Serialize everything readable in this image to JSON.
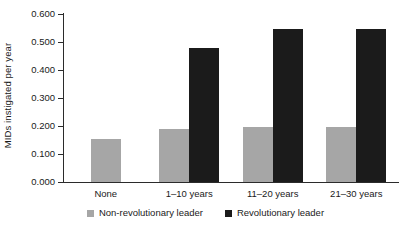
{
  "chart_data": {
    "type": "bar",
    "title": "",
    "subtitle": "",
    "xlabel": "",
    "ylabel": "MIDs instigated per year",
    "categories": [
      "None",
      "1–10 years",
      "11–20 years",
      "21–30 years"
    ],
    "series": [
      {
        "name": "Non-revolutionary leader",
        "color": "#a6a6a6",
        "values": [
          0.155,
          0.19,
          0.195,
          0.195
        ]
      },
      {
        "name": "Revolutionary leader",
        "color": "#1b1b1b",
        "values": [
          null,
          0.48,
          0.545,
          0.545
        ]
      }
    ],
    "ylim": [
      0.0,
      0.6
    ],
    "ytick_values": [
      0.0,
      0.1,
      0.2,
      0.3,
      0.4,
      0.5,
      0.6
    ],
    "ytick_labels": [
      "0.000",
      "0.100",
      "0.200",
      "0.300",
      "0.400",
      "0.500",
      "0.600"
    ],
    "grid": false,
    "legend_position": "bottom",
    "legend_entries": [
      "Non-revolutionary leader",
      "Revolutionary leader"
    ]
  }
}
